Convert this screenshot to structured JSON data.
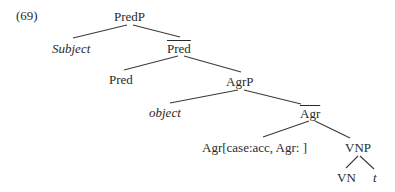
{
  "example_number": "(69)",
  "tree": {
    "nodes": {
      "predp": "PredP",
      "subject": "Subject",
      "pred_bar": "Pred",
      "pred": "Pred",
      "agrp": "AgrP",
      "object": "object",
      "agr_bar": "Agr",
      "agr_features": "Agr[case:acc, Agr: ]",
      "vnp": "VNP",
      "vn": "VN",
      "trace": "t"
    }
  }
}
